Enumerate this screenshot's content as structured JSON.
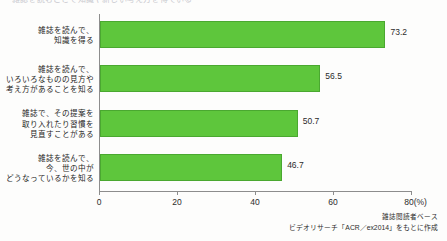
{
  "page": {
    "cut_off_headline": "雑誌を読むことで知識や新しい考え方を得ている"
  },
  "chart_data": {
    "type": "bar",
    "orientation": "horizontal",
    "title": "",
    "xlabel": "",
    "ylabel": "",
    "xlim": [
      0,
      80
    ],
    "xticks": [
      0,
      20,
      40,
      60,
      80
    ],
    "xtick_labels": [
      "0",
      "20",
      "40",
      "60",
      "80(%)"
    ],
    "unit": "%",
    "grid": false,
    "legend": false,
    "bar_color": "#5ec63c",
    "bar_edge_color": "#4aa830",
    "categories": [
      "雑誌を読んで、\n知識を得る",
      "雑誌を読んで、\nいろいろなものの見方や\n考え方があることを知る",
      "雑誌で、その提案を\n取り入れたり習慣を\n見直すことがある",
      "雑誌を読んで、\n今、世の中が\nどうなっているかを知る"
    ],
    "values": [
      73.2,
      56.5,
      50.7,
      46.7
    ],
    "value_labels": [
      "73.2",
      "56.5",
      "50.7",
      "46.7"
    ]
  },
  "footer": {
    "note_base": "雑誌閲読者ベース",
    "note_source": "ビデオリサーチ「ACR／ex2014」をもとに作成"
  }
}
